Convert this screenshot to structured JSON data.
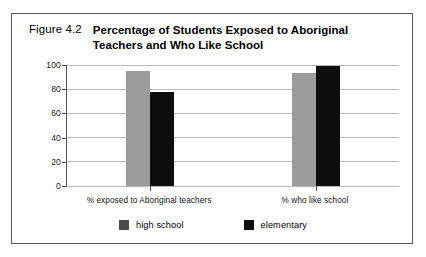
{
  "figure": {
    "number": "Figure 4.2",
    "title": "Percentage of Students Exposed to Aboriginal Teachers and Who Like School"
  },
  "chart_data": {
    "type": "bar",
    "title": "Percentage of Students Exposed to Aboriginal Teachers and Who Like School",
    "xlabel": "",
    "ylabel": "",
    "ylim": [
      0,
      100
    ],
    "yticks": [
      0,
      20,
      40,
      60,
      80,
      100
    ],
    "ytick_labels": [
      "0",
      "20",
      "40",
      "60",
      "80",
      "100"
    ],
    "grid": true,
    "legend_position": "bottom-center",
    "categories": [
      "% exposed to Aboriginal teachers",
      "% who like school"
    ],
    "series": [
      {
        "name": "high school",
        "color": "#9b9b9b",
        "legend_color": "#4a4a4a",
        "values": [
          95,
          93
        ]
      },
      {
        "name": "elementary",
        "color": "#0e0e0e",
        "legend_color": "#0e0e0e",
        "values": [
          78,
          99
        ]
      }
    ]
  },
  "colors": {
    "frame": "#5a5a5a",
    "axis": "#555555",
    "gridline": "#b9b9b9",
    "background": "#ffffff",
    "text": "#000000"
  }
}
